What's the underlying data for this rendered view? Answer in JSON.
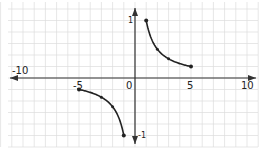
{
  "chart_data": {
    "type": "line",
    "title": "",
    "xlabel": "",
    "ylabel": "",
    "function": "y = 1/x",
    "xlim": [
      -10,
      10
    ],
    "ylim": [
      -1,
      1
    ],
    "grid": true,
    "legend": null,
    "x_tick_labels": [
      "-10",
      "-5",
      "0",
      "5",
      "10"
    ],
    "y_tick_labels": [
      "1",
      "-1"
    ],
    "series": [
      {
        "name": "positive branch",
        "x": [
          1,
          2,
          3,
          5
        ],
        "y": [
          1,
          0.5,
          0.333,
          0.2
        ],
        "endpoints_marked": true
      },
      {
        "name": "negative branch",
        "x": [
          -5,
          -3,
          -2,
          -1
        ],
        "y": [
          -0.2,
          -0.333,
          -0.5,
          -1
        ],
        "endpoints_marked": true
      }
    ],
    "colors": {
      "grid": "#dcdcdc",
      "axes": "#333333",
      "curve": "#222222"
    }
  },
  "labels": {
    "x_neg10": "-10",
    "x_neg5": "-5",
    "x_0": "0",
    "x_5": "5",
    "x_10": "10",
    "y_1": "1",
    "y_neg1": "-1"
  }
}
